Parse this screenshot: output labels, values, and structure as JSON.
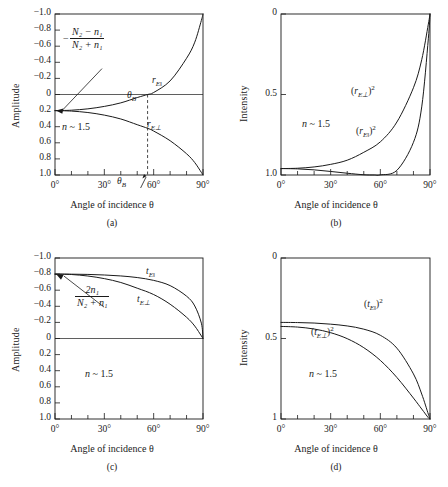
{
  "figure": {
    "background": "#ffffff",
    "axis_color": "#1a1a1a",
    "curve_color": "#1a1a1a"
  },
  "panels": [
    {
      "id": "a",
      "caption": "(a)",
      "ylabel": "Amplitude",
      "xlabel": "Angle of incidence θ",
      "yticks": [
        "1.0",
        "0.8",
        "0.6",
        "0.4",
        "0.2",
        "0",
        "−0.2",
        "−0.4",
        "−0.6",
        "−0.8",
        "−1.0"
      ],
      "xticks": [
        "0°",
        "30°",
        "60°",
        "90°"
      ],
      "note": "n ~ 1.5",
      "note_n": "n",
      "note_rest": " ~ 1.5",
      "annotation": {
        "minus": "−",
        "numerator": "N₂ − n₁",
        "denominator": "N₂ + n₁"
      },
      "curve_labels": [
        {
          "name": "r-parallel",
          "base": "r",
          "sub": "E‖"
        },
        {
          "name": "r-perp",
          "base": "r",
          "sub": "E⊥"
        }
      ],
      "brewster_label": "θ",
      "brewster_sub": "B",
      "brewster_deg": 56.3
    },
    {
      "id": "b",
      "caption": "(b)",
      "ylabel": "Intensity",
      "xlabel": "Angle of incidence θ",
      "yticks": [
        "1.0",
        "0.5",
        "0"
      ],
      "xticks": [
        "0°",
        "30°",
        "60°",
        "90°"
      ],
      "note_n": "n",
      "note_rest": " ~ 1.5",
      "curve_labels": [
        {
          "name": "r-perp-squared",
          "prefix": "(",
          "base": "r",
          "sub": "E⊥",
          "suffix": ")",
          "sup": "2"
        },
        {
          "name": "r-parallel-squared",
          "prefix": "(",
          "base": "r",
          "sub": "E‖",
          "suffix": ")",
          "sup": "2"
        }
      ]
    },
    {
      "id": "c",
      "caption": "(c)",
      "ylabel": "Amplitude",
      "xlabel": "Angle of incidence θ",
      "yticks": [
        "1.0",
        "0.8",
        "0.6",
        "0.4",
        "0.2",
        "0",
        "−0.2",
        "−0.4",
        "−0.6",
        "−0.8",
        "−1.0"
      ],
      "xticks": [
        "0°",
        "30°",
        "60°",
        "90°"
      ],
      "note_n": "n",
      "note_rest": " ~ 1.5",
      "annotation": {
        "minus": "",
        "numerator": "2n₁",
        "denominator": "N₂ + n₁"
      },
      "curve_labels": [
        {
          "name": "t-parallel",
          "base": "t",
          "sub": "E‖"
        },
        {
          "name": "t-perp",
          "base": "t",
          "sub": "E⊥"
        }
      ]
    },
    {
      "id": "d",
      "caption": "(d)",
      "ylabel": "Intensity",
      "xlabel": "Angle of incidence θ",
      "yticks": [
        "1",
        "0.5",
        "0"
      ],
      "xticks": [
        "0°",
        "30°",
        "60°",
        "90°"
      ],
      "note_n": "n",
      "note_rest": " ~ 1.5",
      "curve_labels": [
        {
          "name": "t-parallel-squared",
          "prefix": "(",
          "base": "t",
          "sub": "E‖",
          "suffix": ")",
          "sup": "2"
        },
        {
          "name": "t-perp-squared",
          "prefix": "(",
          "base": "t",
          "sub": "E⊥",
          "suffix": ")",
          "sup": "2"
        }
      ]
    }
  ],
  "chart_data": [
    {
      "type": "line",
      "panel": "a",
      "title": "",
      "xlabel": "Angle of incidence θ",
      "ylabel": "Amplitude",
      "xlim": [
        0,
        90
      ],
      "ylim": [
        -1.0,
        1.0
      ],
      "xticks": [
        0,
        30,
        60,
        90
      ],
      "yticks": [
        -1.0,
        -0.8,
        -0.6,
        -0.4,
        -0.2,
        0,
        0.2,
        0.4,
        0.6,
        0.8,
        1.0
      ],
      "grid": false,
      "refractive_index": 1.5,
      "annotations": [
        "n ~ 1.5",
        "-(N2-n1)/(N2+n1)",
        "theta_B"
      ],
      "brewster_angle_deg": 56.3,
      "series": [
        {
          "name": "r_E‖",
          "x": [
            0,
            10,
            20,
            30,
            40,
            50,
            56.3,
            60,
            70,
            80,
            85,
            89,
            90
          ],
          "values": [
            -0.2,
            -0.195,
            -0.178,
            -0.148,
            -0.104,
            -0.038,
            0.0,
            0.025,
            0.169,
            0.45,
            0.65,
            0.92,
            1.0
          ]
        },
        {
          "name": "r_E⊥",
          "x": [
            0,
            10,
            20,
            30,
            40,
            50,
            56.3,
            60,
            70,
            80,
            85,
            89,
            90
          ],
          "values": [
            -0.2,
            -0.206,
            -0.224,
            -0.256,
            -0.304,
            -0.375,
            -0.42,
            -0.454,
            -0.574,
            -0.736,
            -0.846,
            -0.968,
            -1.0
          ]
        }
      ]
    },
    {
      "type": "line",
      "panel": "b",
      "title": "",
      "xlabel": "Angle of incidence θ",
      "ylabel": "Intensity",
      "xlim": [
        0,
        90
      ],
      "ylim": [
        0,
        1.0
      ],
      "xticks": [
        0,
        30,
        60,
        90
      ],
      "yticks": [
        0,
        0.5,
        1.0
      ],
      "grid": false,
      "refractive_index": 1.5,
      "annotations": [
        "n ~ 1.5"
      ],
      "series": [
        {
          "name": "(r_E⊥)²",
          "x": [
            0,
            10,
            20,
            30,
            40,
            50,
            60,
            70,
            80,
            85,
            89,
            90
          ],
          "values": [
            0.04,
            0.042,
            0.05,
            0.066,
            0.092,
            0.141,
            0.206,
            0.329,
            0.542,
            0.716,
            0.937,
            1.0
          ]
        },
        {
          "name": "(r_E‖)²",
          "x": [
            0,
            10,
            20,
            30,
            40,
            50,
            56.3,
            60,
            70,
            80,
            85,
            89,
            90
          ],
          "values": [
            0.04,
            0.038,
            0.032,
            0.022,
            0.011,
            0.0014,
            0.0,
            0.0006,
            0.029,
            0.203,
            0.423,
            0.846,
            1.0
          ]
        }
      ]
    },
    {
      "type": "line",
      "panel": "c",
      "title": "",
      "xlabel": "Angle of incidence θ",
      "ylabel": "Amplitude",
      "xlim": [
        0,
        90
      ],
      "ylim": [
        -1.0,
        1.0
      ],
      "xticks": [
        0,
        30,
        60,
        90
      ],
      "yticks": [
        -1.0,
        -0.8,
        -0.6,
        -0.4,
        -0.2,
        0,
        0.2,
        0.4,
        0.6,
        0.8,
        1.0
      ],
      "grid": false,
      "refractive_index": 1.5,
      "annotations": [
        "n ~ 1.5",
        "2n1/(N2+n1)"
      ],
      "series": [
        {
          "name": "t_E‖",
          "x": [
            0,
            10,
            20,
            30,
            40,
            50,
            60,
            70,
            80,
            85,
            89,
            90
          ],
          "values": [
            0.8,
            0.799,
            0.796,
            0.789,
            0.777,
            0.757,
            0.722,
            0.657,
            0.526,
            0.404,
            0.19,
            0.0
          ]
        },
        {
          "name": "t_E⊥",
          "x": [
            0,
            10,
            20,
            30,
            40,
            50,
            60,
            70,
            80,
            85,
            89,
            90
          ],
          "values": [
            0.8,
            0.795,
            0.776,
            0.744,
            0.696,
            0.625,
            0.546,
            0.426,
            0.264,
            0.154,
            0.032,
            0.0
          ]
        }
      ]
    },
    {
      "type": "line",
      "panel": "d",
      "title": "",
      "xlabel": "Angle of incidence θ",
      "ylabel": "Intensity",
      "xlim": [
        0,
        90
      ],
      "ylim": [
        0,
        1.0
      ],
      "xticks": [
        0,
        30,
        60,
        90
      ],
      "yticks": [
        0,
        0.5,
        1.0
      ],
      "grid": false,
      "refractive_index": 1.5,
      "annotations": [
        "n ~ 1.5"
      ],
      "series": [
        {
          "name": "(t_E‖)²",
          "x": [
            0,
            10,
            20,
            30,
            40,
            50,
            60,
            70,
            80,
            85,
            89,
            90
          ],
          "values": [
            0.6,
            0.599,
            0.596,
            0.589,
            0.578,
            0.558,
            0.52,
            0.44,
            0.28,
            0.155,
            0.03,
            0.0
          ]
        },
        {
          "name": "(t_E⊥)²",
          "x": [
            0,
            10,
            20,
            30,
            40,
            50,
            60,
            70,
            80,
            85,
            89,
            90
          ],
          "values": [
            0.575,
            0.571,
            0.559,
            0.536,
            0.499,
            0.443,
            0.364,
            0.258,
            0.13,
            0.062,
            0.008,
            0.0
          ]
        }
      ]
    }
  ]
}
